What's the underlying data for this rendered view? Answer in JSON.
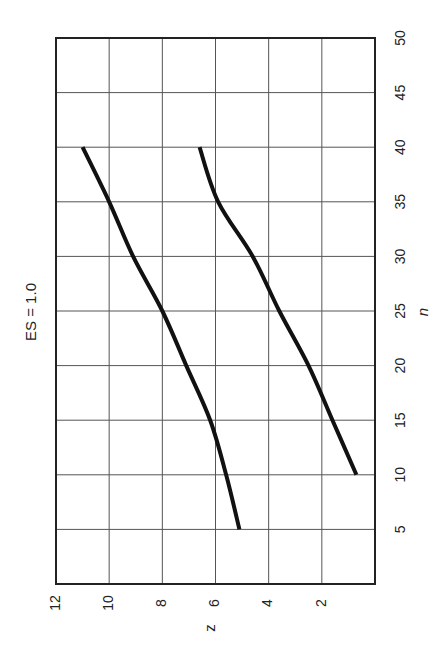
{
  "chart_data": {
    "type": "line",
    "orientation": "rotated-90",
    "title": "ES = 1.0",
    "xlabel": "n",
    "ylabel": "z",
    "xlim": [
      0,
      50
    ],
    "ylim": [
      0,
      12
    ],
    "x_ticks": [
      5,
      10,
      15,
      20,
      25,
      30,
      35,
      40,
      45,
      50
    ],
    "y_ticks": [
      2,
      4,
      6,
      8,
      10,
      12
    ],
    "grid": true,
    "legend": null,
    "series": [
      {
        "name": "upper curve",
        "x": [
          5,
          10,
          15,
          20,
          25,
          30,
          35,
          40
        ],
        "values": [
          5.1,
          5.6,
          6.2,
          7.1,
          8.0,
          9.1,
          10.0,
          11.0
        ]
      },
      {
        "name": "lower curve",
        "x": [
          10,
          15,
          20,
          25,
          30,
          35,
          40
        ],
        "values": [
          0.7,
          1.6,
          2.5,
          3.6,
          4.6,
          5.9,
          6.6
        ]
      }
    ]
  },
  "colors": {
    "line": "#111111",
    "grid": "#555555",
    "frame": "#222222",
    "background": "#ffffff"
  }
}
